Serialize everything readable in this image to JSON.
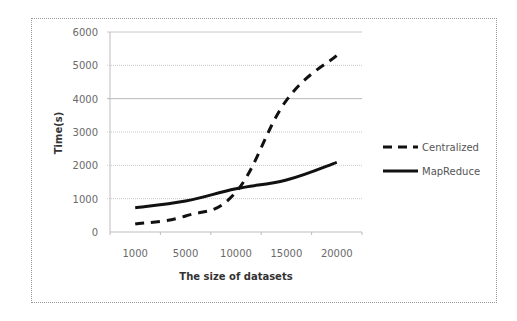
{
  "chart_data": {
    "type": "line",
    "title": "",
    "xlabel": "The size of datasets",
    "ylabel": "Time(s)",
    "categories": [
      "1000",
      "5000",
      "10000",
      "15000",
      "20000"
    ],
    "series": [
      {
        "name": "Centralized",
        "style": "dashed",
        "color": "#111111",
        "values": [
          240,
          480,
          1200,
          3950,
          5300
        ]
      },
      {
        "name": "MapReduce",
        "style": "solid",
        "color": "#111111",
        "values": [
          730,
          930,
          1300,
          1560,
          2090
        ]
      }
    ],
    "ylim": [
      0,
      6000
    ],
    "yticks": [
      "0",
      "1000",
      "2000",
      "3000",
      "4000",
      "5000",
      "6000"
    ],
    "grid": true,
    "legend_position": "right"
  }
}
